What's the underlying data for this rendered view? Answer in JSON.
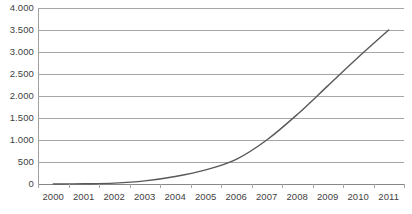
{
  "chart_data": {
    "type": "line",
    "title": "",
    "subtitle": "",
    "xlabel": "",
    "ylabel": "",
    "categories": [
      "2000",
      "2001",
      "2002",
      "2003",
      "2004",
      "2005",
      "2006",
      "2007",
      "2008",
      "2009",
      "2010",
      "2011"
    ],
    "values": [
      0,
      5,
      20,
      70,
      170,
      320,
      560,
      1000,
      1580,
      2230,
      2880,
      3500
    ],
    "series": [
      {
        "name": "",
        "values": [
          0,
          5,
          20,
          70,
          170,
          320,
          560,
          1000,
          1580,
          2230,
          2880,
          3500
        ]
      }
    ],
    "ylim": [
      0,
      4000
    ],
    "ytick_values": [
      0,
      500,
      1000,
      1500,
      2000,
      2500,
      3000,
      3500,
      4000
    ],
    "ytick_labels": [
      "0",
      "500",
      "1.000",
      "1.500",
      "2.000",
      "2.500",
      "3.000",
      "3.500",
      "4.000"
    ],
    "grid": true,
    "grid_axis": "y",
    "legend": false,
    "legend_position": "none",
    "line_color": "#595959",
    "grid_color": "#a6a6a6",
    "axis_color": "#a0a0a0",
    "text_color": "#3f3f3f",
    "background_color": "#ffffff",
    "markers": false,
    "smooth": true,
    "annotations": []
  }
}
